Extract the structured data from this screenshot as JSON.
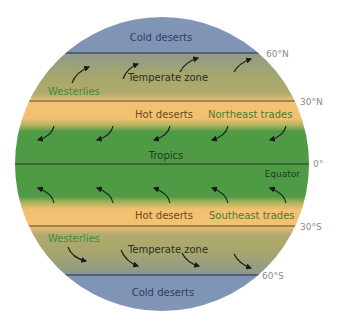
{
  "diagram": {
    "type": "global-climate-zones",
    "zones": [
      {
        "id": "cold-north",
        "label": "Cold deserts"
      },
      {
        "id": "temperate-north",
        "label": "Temperate zone",
        "wind_label": "Westerlies"
      },
      {
        "id": "hot-north",
        "label": "Hot deserts",
        "wind_label": "Northeast trades"
      },
      {
        "id": "tropics",
        "label": "Tropics",
        "line_label": "Equator"
      },
      {
        "id": "hot-south",
        "label": "Hot deserts",
        "wind_label": "Southeast trades"
      },
      {
        "id": "temperate-south",
        "label": "Temperate zone",
        "wind_label": "Westerlies"
      },
      {
        "id": "cold-south",
        "label": "Cold deserts"
      }
    ],
    "latitudes": {
      "n60": "60°N",
      "n30": "30°N",
      "eq": "0°",
      "s30": "30°S",
      "s60": "60°S"
    },
    "colors": {
      "cold": "#7f94b4",
      "temperate": "#a8a86a",
      "hot": "#f2c172",
      "tropics": "#4e9a45",
      "line": "#2a2a2a",
      "green_text": "#3f8a3e",
      "latitude_text": "#8a8a8a"
    },
    "arrows": {
      "westerlies_north": "northeast",
      "northeast_trades": "southwest",
      "southeast_trades": "northwest",
      "westerlies_south": "southeast"
    }
  }
}
